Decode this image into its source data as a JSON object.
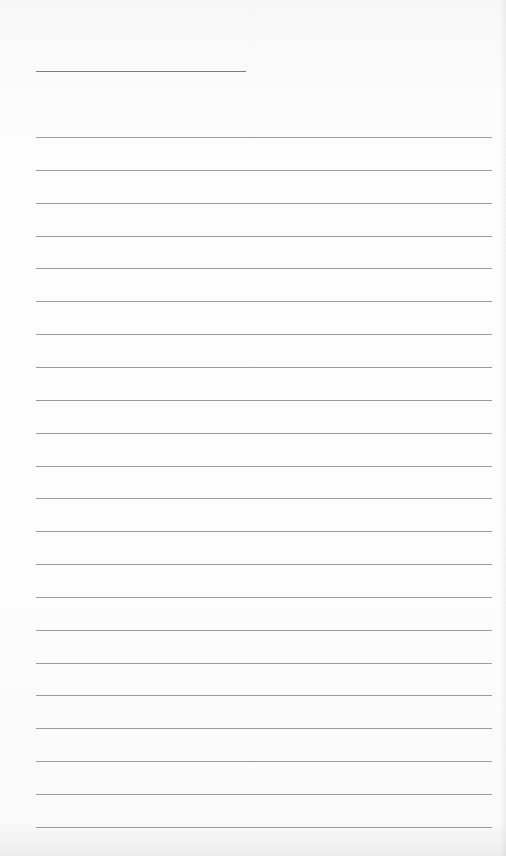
{
  "document": {
    "type": "blank lined paper",
    "background_color": "#fbfbfb",
    "line_color": "#8a8a8a",
    "title_line": {
      "x1": 36,
      "x2": 246,
      "y": 71
    },
    "ruled_lines": {
      "x1": 36,
      "x2": 492,
      "first_y": 137,
      "spacing": 32.85,
      "count": 22
    }
  }
}
